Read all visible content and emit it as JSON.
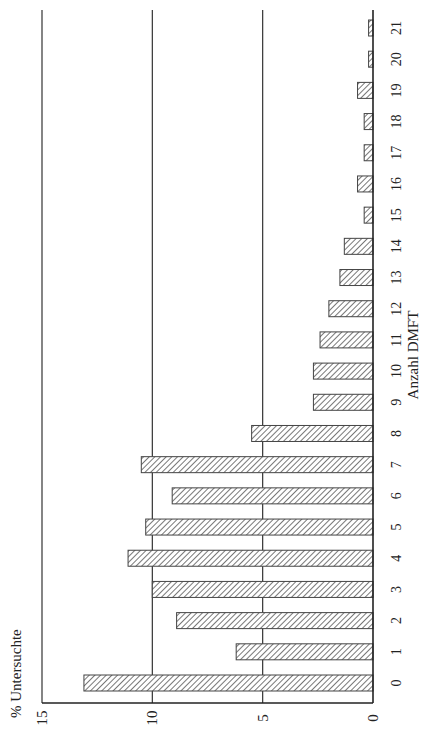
{
  "chart_data": {
    "type": "bar",
    "orientation": "rotated-90 (vertical bars drawn sideways)",
    "title": "",
    "xlabel": "Anzahl DMFT",
    "ylabel": "% Untersuchte",
    "categories": [
      "0",
      "1",
      "2",
      "3",
      "4",
      "5",
      "6",
      "7",
      "8",
      "9",
      "10",
      "11",
      "12",
      "13",
      "14",
      "15",
      "16",
      "17",
      "18",
      "19",
      "20",
      "21"
    ],
    "values": [
      13.1,
      6.2,
      8.9,
      10.0,
      11.1,
      10.3,
      9.1,
      10.5,
      5.5,
      2.7,
      2.7,
      2.4,
      2.0,
      1.5,
      1.3,
      0.4,
      0.7,
      0.4,
      0.4,
      0.7,
      0.2,
      0.2
    ],
    "ylim": [
      0,
      15
    ],
    "yticks": [
      "0",
      "5",
      "10",
      "15"
    ],
    "grid": true,
    "gridlines_at": [
      5,
      10,
      15
    ],
    "bar_fill": "diagonal hatch",
    "colors": {
      "bar_stroke": "#444444",
      "hatch": "#555555",
      "axis": "#222222",
      "background": "#ffffff"
    }
  }
}
